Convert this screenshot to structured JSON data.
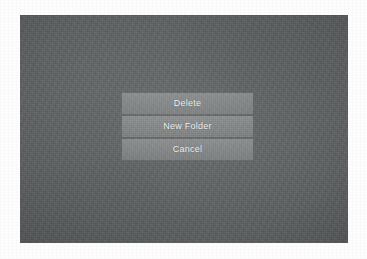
{
  "page": {
    "background_color": "#fdfdfd"
  },
  "screen": {
    "name": "photographed-device-screen",
    "background_color": "#5b5e5f",
    "overlay_color": "#6e7173"
  },
  "action_sheet": {
    "name": "action-sheet",
    "buttons": [
      {
        "label": "Delete",
        "name": "delete-button"
      },
      {
        "label": "New Folder",
        "name": "new-folder-button"
      },
      {
        "label": "Cancel",
        "name": "cancel-button"
      }
    ]
  }
}
